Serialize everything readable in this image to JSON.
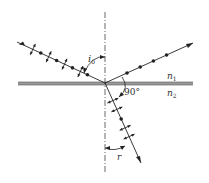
{
  "labels": {
    "incidence_angle": "i",
    "incidence_angle_sub": "0",
    "refraction_angle": "r",
    "right_angle": "90°",
    "medium_1": "n",
    "medium_1_sub": "1",
    "medium_2": "n",
    "medium_2_sub": "2"
  },
  "rays": {
    "incident": {
      "polarization": "both (dots and arrows)"
    },
    "reflected": {
      "polarization": "perpendicular only (dots)"
    },
    "refracted": {
      "polarization": "partially polarized (mostly arrows)"
    }
  },
  "colors": {
    "line": "#222222",
    "interface": "#888888"
  }
}
